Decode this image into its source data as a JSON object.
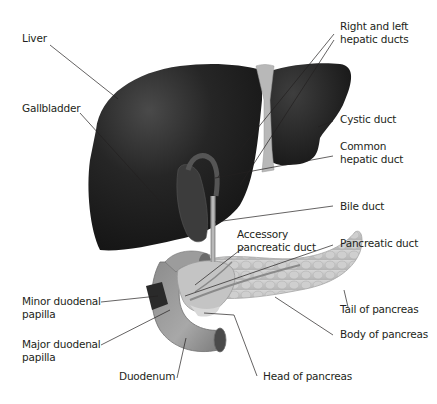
{
  "diagram": {
    "colors": {
      "liver": "#1e1e1e",
      "liver_highlight": "#4a4a4a",
      "ligament": "#b8b8b8",
      "duct": "#8a8a8a",
      "pancreas": "#c8c8c8",
      "duodenum": "#9a9a9a",
      "leader_line": "#231f20",
      "text": "#231f20"
    },
    "labels": {
      "liver": {
        "line1": "Liver"
      },
      "gallbladder": {
        "line1": "Gallbladder"
      },
      "right_left_hepatic": {
        "line1": "Right and left",
        "line2": "hepatic ducts"
      },
      "cystic_duct": {
        "line1": "Cystic duct"
      },
      "common_hepatic": {
        "line1": "Common",
        "line2": "hepatic duct"
      },
      "bile_duct": {
        "line1": "Bile duct"
      },
      "accessory_pancreatic": {
        "line1": "Accessory",
        "line2": "pancreatic duct"
      },
      "pancreatic_duct": {
        "line1": "Pancreatic duct"
      },
      "minor_papilla": {
        "line1": "Minor duodenal",
        "line2": "papilla"
      },
      "major_papilla": {
        "line1": "Major duodenal",
        "line2": "papilla"
      },
      "tail_pancreas": {
        "line1": "Tail of pancreas"
      },
      "body_pancreas": {
        "line1": "Body of pancreas"
      },
      "duodenum": {
        "line1": "Duodenum"
      },
      "head_pancreas": {
        "line1": "Head of pancreas"
      }
    }
  }
}
